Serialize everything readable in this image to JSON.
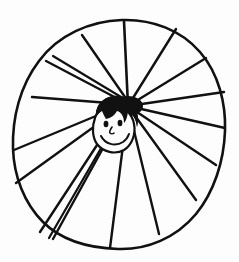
{
  "artwork": {
    "title": "Hand-drawn radial sun with smiling face",
    "medium": "black ink line drawing on white paper",
    "style": "rough hand-drawn marker sketch",
    "canvas": {
      "width": 239,
      "height": 262,
      "background_color": "#fdfdfd"
    },
    "ink_color": "#111111"
  },
  "outline": {
    "name": "egg-shaped outer boundary",
    "shape": "closed irregular oval / egg, tilted slightly",
    "stroke_width": 2.6,
    "bounds": {
      "left": 12,
      "top": 19,
      "right": 226,
      "bottom": 250
    },
    "path": "M 122,20 C 152,19 181,30 200,52 C 219,74 226,104 225,131 C 224,161 214,192 196,214 C 176,238 147,250 118,249 C 89,248 61,240 43,222 C 24,203 14,176 13,149 C 12,118 20,86 39,61 C 58,35 90,21 122,20 Z"
  },
  "hub": {
    "name": "spoke convergence point",
    "x": 128,
    "y": 106,
    "description": "dark ink blot where all spokes meet, just above the face"
  },
  "spokes": {
    "name": "radiating lines",
    "count": 17,
    "stroke_width": 2.4,
    "description": "straight hand-drawn rays from the central hub out to the egg outline",
    "lines": [
      {
        "id": "spoke-n",
        "x1": 128,
        "y1": 106,
        "x2": 124,
        "y2": 21,
        "width": 2.6
      },
      {
        "id": "spoke-nne",
        "x1": 128,
        "y1": 106,
        "x2": 176,
        "y2": 29,
        "width": 2.4
      },
      {
        "id": "spoke-ne",
        "x1": 128,
        "y1": 106,
        "x2": 206,
        "y2": 58,
        "width": 2.4
      },
      {
        "id": "spoke-ene",
        "x1": 128,
        "y1": 106,
        "x2": 224,
        "y2": 92,
        "width": 2.4
      },
      {
        "id": "spoke-e",
        "x1": 128,
        "y1": 106,
        "x2": 225,
        "y2": 128,
        "width": 2.4
      },
      {
        "id": "spoke-ese",
        "x1": 128,
        "y1": 106,
        "x2": 216,
        "y2": 165,
        "width": 2.4
      },
      {
        "id": "spoke-se",
        "x1": 128,
        "y1": 106,
        "x2": 196,
        "y2": 200,
        "width": 2.4
      },
      {
        "id": "spoke-sse",
        "x1": 128,
        "y1": 106,
        "x2": 159,
        "y2": 234,
        "width": 2.4
      },
      {
        "id": "spoke-s",
        "x1": 128,
        "y1": 106,
        "x2": 110,
        "y2": 248,
        "width": 2.4
      },
      {
        "id": "spoke-ssw-a",
        "x1": 124,
        "y1": 110,
        "x2": 53,
        "y2": 239,
        "width": 2.4
      },
      {
        "id": "spoke-ssw-b",
        "x1": 122,
        "y1": 112,
        "x2": 49,
        "y2": 238,
        "width": 2.2
      },
      {
        "id": "spoke-sw",
        "x1": 120,
        "y1": 110,
        "x2": 40,
        "y2": 232,
        "width": 2.4
      },
      {
        "id": "spoke-wsw",
        "x1": 120,
        "y1": 108,
        "x2": 16,
        "y2": 183,
        "width": 2.4
      },
      {
        "id": "spoke-w",
        "x1": 120,
        "y1": 106,
        "x2": 14,
        "y2": 150,
        "width": 2.4
      },
      {
        "id": "spoke-wnw",
        "x1": 122,
        "y1": 104,
        "x2": 32,
        "y2": 97,
        "width": 2.4
      },
      {
        "id": "spoke-nw-a",
        "x1": 124,
        "y1": 102,
        "x2": 46,
        "y2": 61,
        "width": 2.4
      },
      {
        "id": "spoke-nw-b",
        "x1": 126,
        "y1": 100,
        "x2": 53,
        "y2": 56,
        "width": 2.2
      },
      {
        "id": "spoke-nnw",
        "x1": 127,
        "y1": 100,
        "x2": 82,
        "y2": 35,
        "width": 2.4
      }
    ]
  },
  "face": {
    "name": "smiling face at centre",
    "center": {
      "x": 112,
      "y": 130
    },
    "head": {
      "shape": "rounded oval head outline",
      "path": "M 95,118 C 92,126 92,137 97,144 C 103,152 115,155 124,150 C 132,145 136,134 134,124 C 132,113 124,106 113,106 C 104,106 97,111 95,118 Z",
      "stroke_width": 2.2
    },
    "hair": {
      "description": "thick spiky black hair covering the top and sides of the head",
      "color": "#111111",
      "path": "M 96,117 C 95,108 100,100 109,97 C 118,94 128,97 133,104 C 138,111 139,119 137,127 C 136,119 133,114 128,112 C 127,118 126,121 124,123 C 124,116 121,112 117,111 C 114,116 111,118 106,119 C 104,116 103,113 102,111 C 99,113 97,115 96,117 Z"
    },
    "eyes": [
      {
        "id": "eye-left",
        "cx": 106,
        "cy": 124,
        "rx": 2.4,
        "ry": 3.2
      },
      {
        "id": "eye-right",
        "cx": 120,
        "cy": 123,
        "rx": 2.4,
        "ry": 3.2
      }
    ],
    "nose": {
      "id": "nose",
      "path": "M 112,127 C 110,130 109,132 110,133 C 111,134 113,134 114,133",
      "stroke_width": 1.6
    },
    "mouth": {
      "id": "smiling-mouth",
      "description": "upward curving smile",
      "path": "M 101,136 C 105,144 115,147 123,142 C 126,140 128,137 129,134",
      "stroke_width": 2.0
    }
  }
}
